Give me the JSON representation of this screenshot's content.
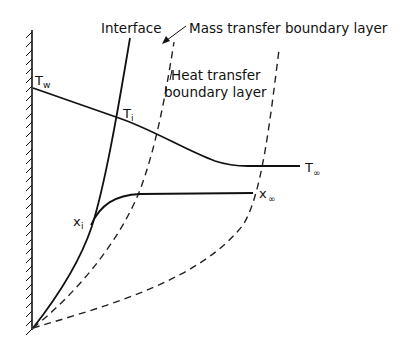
{
  "labels": {
    "interface": "Interface",
    "mass_bl": "Mass transfer boundary layer",
    "heat_bl_line1": "Heat transfer",
    "heat_bl_line2": "boundary layer",
    "t_wall": "T",
    "t_wall_sub": "w",
    "t_interface": "T",
    "t_interface_sub": "i",
    "t_inf": "T",
    "t_inf_sub": "∞",
    "x_interface": "x",
    "x_interface_sub": "i",
    "x_inf": "x",
    "x_inf_sub": "∞"
  },
  "colors": {
    "line": "#111111",
    "dash": "#222222",
    "background": "#ffffff"
  }
}
